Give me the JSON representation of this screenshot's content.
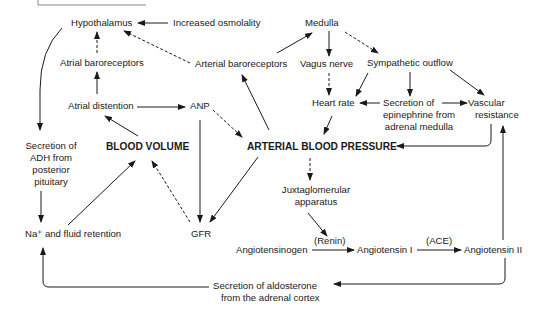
{
  "diagram": {
    "title_box_fragment": "",
    "nodes": {
      "hypothalamus": "Hypothalamus",
      "increased_osmolality": "Increased osmolality",
      "medulla": "Medulla",
      "atrial_baroreceptors": "Atrial baroreceptors",
      "arterial_baroreceptors": "Arterial baroreceptors",
      "vagus_nerve": "Vagus nerve",
      "sympathetic_outflow": "Sympathetic outflow",
      "atrial_distention": "Atrial distention",
      "anp": "ANP",
      "heart_rate": "Heart rate",
      "epinephrine_line1": "Secretion of",
      "epinephrine_line2": "epinephrine from",
      "epinephrine_line3": "adrenal medulla",
      "vascular_line1": "Vascular",
      "vascular_line2": "resistance",
      "adh_line1": "Secretion of",
      "adh_line2": "ADH from",
      "adh_line3": "posterior",
      "adh_line4": "pituitary",
      "blood_volume": "BLOOD VOLUME",
      "arterial_blood_pressure": "ARTERIAL BLOOD PRESSURE",
      "juxta_line1": "Juxtaglomerular",
      "juxta_line2": "apparatus",
      "na_retention": "Na⁺ and fluid retention",
      "gfr": "GFR",
      "angiotensinogen": "Angiotensinogen",
      "angiotensin_1": "Angiotensin I",
      "angiotensin_2": "Angiotensin II",
      "aldosterone_line1": "Secretion of aldosterone",
      "aldosterone_line2": "from the adrenal cortex"
    },
    "edge_labels": {
      "renin": "(Renin)",
      "ace": "(ACE)"
    },
    "edges": [
      {
        "from": "Increased osmolality",
        "to": "Hypothalamus",
        "style": "solid"
      },
      {
        "from": "Atrial baroreceptors",
        "to": "Hypothalamus",
        "style": "dashed"
      },
      {
        "from": "Arterial baroreceptors",
        "to": "Hypothalamus",
        "style": "dashed"
      },
      {
        "from": "Atrial distention",
        "to": "Atrial baroreceptors",
        "style": "solid"
      },
      {
        "from": "Atrial distention",
        "to": "ANP",
        "style": "solid"
      },
      {
        "from": "BLOOD VOLUME",
        "to": "Atrial distention",
        "style": "solid"
      },
      {
        "from": "ANP",
        "to": "ARTERIAL BLOOD PRESSURE",
        "style": "dashed"
      },
      {
        "from": "ANP",
        "to": "GFR",
        "style": "solid"
      },
      {
        "from": "ARTERIAL BLOOD PRESSURE",
        "to": "Arterial baroreceptors",
        "style": "solid"
      },
      {
        "from": "ARTERIAL BLOOD PRESSURE",
        "to": "GFR",
        "style": "solid"
      },
      {
        "from": "ARTERIAL BLOOD PRESSURE",
        "to": "Juxtaglomerular apparatus",
        "style": "dashed"
      },
      {
        "from": "Arterial baroreceptors",
        "to": "Medulla",
        "style": "solid"
      },
      {
        "from": "Medulla",
        "to": "Vagus nerve",
        "style": "solid"
      },
      {
        "from": "Medulla",
        "to": "Sympathetic outflow",
        "style": "dashed"
      },
      {
        "from": "Vagus nerve",
        "to": "Heart rate",
        "style": "dashed"
      },
      {
        "from": "Sympathetic outflow",
        "to": "Heart rate",
        "style": "solid"
      },
      {
        "from": "Sympathetic outflow",
        "to": "Secretion of epinephrine from adrenal medulla",
        "style": "solid"
      },
      {
        "from": "Sympathetic outflow",
        "to": "Vascular resistance",
        "style": "solid"
      },
      {
        "from": "Secretion of epinephrine from adrenal medulla",
        "to": "Heart rate",
        "style": "solid"
      },
      {
        "from": "Secretion of epinephrine from adrenal medulla",
        "to": "Vascular resistance",
        "style": "solid"
      },
      {
        "from": "Heart rate",
        "to": "ARTERIAL BLOOD PRESSURE",
        "style": "solid"
      },
      {
        "from": "Vascular resistance",
        "to": "ARTERIAL BLOOD PRESSURE",
        "style": "solid"
      },
      {
        "from": "Hypothalamus",
        "to": "Secretion of ADH from posterior pituitary",
        "style": "solid"
      },
      {
        "from": "Secretion of ADH from posterior pituitary",
        "to": "Na+ and fluid retention",
        "style": "solid"
      },
      {
        "from": "Na+ and fluid retention",
        "to": "BLOOD VOLUME",
        "style": "solid"
      },
      {
        "from": "GFR",
        "to": "BLOOD VOLUME",
        "style": "dashed"
      },
      {
        "from": "Juxtaglomerular apparatus",
        "to": "Angiotensinogen-Angiotensin I (Renin)",
        "style": "solid"
      },
      {
        "from": "Angiotensinogen",
        "to": "Angiotensin I",
        "label": "(Renin)",
        "style": "solid"
      },
      {
        "from": "Angiotensin I",
        "to": "Angiotensin II",
        "label": "(ACE)",
        "style": "solid"
      },
      {
        "from": "Angiotensin II",
        "to": "Vascular resistance",
        "style": "solid"
      },
      {
        "from": "Angiotensin II",
        "to": "Secretion of aldosterone from the adrenal cortex",
        "style": "solid"
      },
      {
        "from": "Secretion of aldosterone from the adrenal cortex",
        "to": "Na+ and fluid retention",
        "style": "solid"
      }
    ],
    "colors": {
      "ink": "#1a1a1a",
      "background": "#ffffff"
    }
  }
}
